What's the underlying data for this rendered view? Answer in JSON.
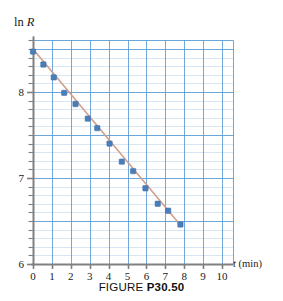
{
  "figure": {
    "caption_word": "FIGURE",
    "caption_id": "P30.50"
  },
  "chart_data": {
    "type": "scatter",
    "title": "",
    "xlabel_prefix": "t",
    "xlabel_suffix": " (min)",
    "ylabel_prefix": "ln ",
    "ylabel_suffix": "R",
    "xlim": [
      0,
      10.6
    ],
    "ylim": [
      6,
      8.6
    ],
    "xticks": [
      0,
      1,
      2,
      3,
      4,
      5,
      6,
      7,
      8,
      9,
      10
    ],
    "xtick_labels": [
      "0",
      "1",
      "2",
      "3",
      "4",
      "5",
      "6",
      "7",
      "8",
      "9",
      "10"
    ],
    "yticks": [
      6,
      7,
      8
    ],
    "ytick_labels": [
      "6",
      "7",
      "8"
    ],
    "grid": true,
    "grid_major_x_step": 1,
    "grid_major_y_step": 0.5,
    "grid_minor_y_step": 0.1,
    "legend": "none",
    "point_color": "#4a7ebb",
    "line_color": "#d4a08a",
    "grid_color": "#5b9bd5",
    "axis_color": "#808080",
    "series": [
      {
        "name": "data",
        "marker": "square",
        "x": [
          0.0,
          0.55,
          1.1,
          1.65,
          2.25,
          2.9,
          3.4,
          4.05,
          4.7,
          5.3,
          5.95,
          6.6,
          7.15,
          7.8
        ],
        "y": [
          8.47,
          8.32,
          8.17,
          7.99,
          7.86,
          7.69,
          7.58,
          7.4,
          7.19,
          7.08,
          6.88,
          6.7,
          6.62,
          6.46
        ]
      },
      {
        "name": "best-fit-line",
        "marker": "none",
        "x": [
          0.0,
          7.85
        ],
        "y": [
          8.5,
          6.44
        ]
      }
    ]
  }
}
